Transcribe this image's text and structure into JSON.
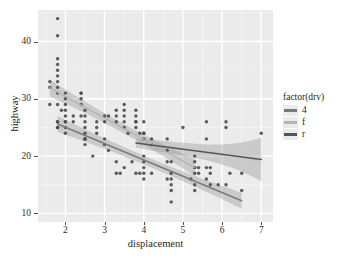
{
  "chart_data": {
    "type": "scatter",
    "title": "",
    "xlabel": "displacement",
    "ylabel": "highway",
    "xlim": [
      1.3,
      7.3
    ],
    "ylim": [
      8.5,
      45.5
    ],
    "xticks": [
      2,
      3,
      4,
      5,
      6,
      7
    ],
    "yticks": [
      10,
      20,
      30,
      40
    ],
    "grid": true,
    "panel_background": "#ebebeb",
    "gridline_color": "#ffffff",
    "point_color": "#4d4d4d",
    "legend": {
      "title": "factor(drv)",
      "position": "right",
      "entries": [
        {
          "label": "4",
          "color": "#7a7a7a"
        },
        {
          "label": "f",
          "color": "#b5b5b5"
        },
        {
          "label": "r",
          "color": "#555555"
        }
      ]
    },
    "series": [
      {
        "name": "4",
        "label": "4",
        "color": "#7a7a7a",
        "smooth": {
          "x_start": 1.8,
          "y_start": 25.6,
          "x_end": 6.5,
          "y_end": 12.2,
          "band": 1.4
        },
        "points": [
          [
            1.8,
            26
          ],
          [
            1.8,
            25
          ],
          [
            1.8,
            26
          ],
          [
            1.8,
            25
          ],
          [
            2.0,
            26
          ],
          [
            2.0,
            25
          ],
          [
            2.0,
            24
          ],
          [
            2.0,
            26
          ],
          [
            2.2,
            26
          ],
          [
            2.5,
            23
          ],
          [
            2.5,
            24
          ],
          [
            2.5,
            23
          ],
          [
            2.5,
            22
          ],
          [
            2.5,
            25
          ],
          [
            2.5,
            23
          ],
          [
            2.7,
            20
          ],
          [
            2.8,
            24
          ],
          [
            3.0,
            22
          ],
          [
            3.0,
            23
          ],
          [
            3.1,
            21
          ],
          [
            3.3,
            19
          ],
          [
            3.3,
            17
          ],
          [
            3.4,
            17
          ],
          [
            3.5,
            18
          ],
          [
            3.7,
            19
          ],
          [
            3.8,
            17
          ],
          [
            3.9,
            17
          ],
          [
            4.0,
            20
          ],
          [
            4.0,
            19
          ],
          [
            4.0,
            18
          ],
          [
            4.0,
            17
          ],
          [
            4.0,
            16
          ],
          [
            4.2,
            17
          ],
          [
            4.6,
            16
          ],
          [
            4.7,
            15
          ],
          [
            4.7,
            16
          ],
          [
            4.7,
            17
          ],
          [
            4.7,
            14
          ],
          [
            4.7,
            12
          ],
          [
            5.2,
            16
          ],
          [
            5.3,
            15
          ],
          [
            5.3,
            14
          ],
          [
            5.4,
            17
          ],
          [
            5.6,
            16
          ],
          [
            5.7,
            15
          ],
          [
            5.9,
            15
          ],
          [
            6.1,
            15
          ],
          [
            6.5,
            14
          ]
        ]
      },
      {
        "name": "f",
        "label": "f",
        "color": "#b5b5b5",
        "smooth": {
          "x_start": 1.6,
          "y_start": 31.9,
          "x_end": 5.3,
          "y_end": 18.0,
          "band": 1.5
        },
        "points": [
          [
            1.6,
            33
          ],
          [
            1.6,
            32
          ],
          [
            1.6,
            29
          ],
          [
            1.8,
            44
          ],
          [
            1.8,
            41
          ],
          [
            1.8,
            37
          ],
          [
            1.8,
            36
          ],
          [
            1.8,
            35
          ],
          [
            1.8,
            34
          ],
          [
            1.8,
            33
          ],
          [
            1.8,
            32
          ],
          [
            1.8,
            31
          ],
          [
            1.8,
            29
          ],
          [
            1.9,
            28
          ],
          [
            2.0,
            31
          ],
          [
            2.0,
            29
          ],
          [
            2.0,
            28
          ],
          [
            2.0,
            27
          ],
          [
            2.0,
            30
          ],
          [
            2.2,
            27
          ],
          [
            2.4,
            31
          ],
          [
            2.4,
            30
          ],
          [
            2.4,
            31
          ],
          [
            2.4,
            29
          ],
          [
            2.4,
            27
          ],
          [
            2.5,
            27
          ],
          [
            2.5,
            26
          ],
          [
            2.5,
            28
          ],
          [
            2.8,
            26
          ],
          [
            2.8,
            25
          ],
          [
            3.0,
            27
          ],
          [
            3.0,
            26
          ],
          [
            3.1,
            27
          ],
          [
            3.3,
            28
          ],
          [
            3.3,
            27
          ],
          [
            3.3,
            26
          ],
          [
            3.5,
            29
          ],
          [
            3.5,
            28
          ],
          [
            3.5,
            27
          ],
          [
            3.5,
            26
          ],
          [
            3.5,
            25
          ],
          [
            3.6,
            24
          ],
          [
            3.8,
            28
          ],
          [
            3.8,
            27
          ],
          [
            3.8,
            26
          ],
          [
            3.8,
            25
          ],
          [
            3.9,
            24
          ],
          [
            4.0,
            26
          ],
          [
            4.0,
            24
          ],
          [
            4.2,
            23
          ],
          [
            4.6,
            19
          ],
          [
            4.7,
            19
          ],
          [
            5.3,
            18
          ],
          [
            5.3,
            17
          ]
        ]
      },
      {
        "name": "r",
        "label": "r",
        "color": "#555555",
        "smooth": {
          "x_start": 3.8,
          "y_start": 22.3,
          "x_end": 7.0,
          "y_end": 19.4,
          "band_start": 0.8,
          "band_end": 3.8
        },
        "points": [
          [
            3.8,
            26
          ],
          [
            4.0,
            24
          ],
          [
            4.0,
            23
          ],
          [
            4.2,
            22
          ],
          [
            4.6,
            21
          ],
          [
            4.6,
            23
          ],
          [
            5.0,
            25
          ],
          [
            5.3,
            20
          ],
          [
            5.3,
            19
          ],
          [
            5.3,
            18
          ],
          [
            5.4,
            18
          ],
          [
            5.6,
            26
          ],
          [
            5.6,
            23
          ],
          [
            5.6,
            18
          ],
          [
            5.7,
            17
          ],
          [
            5.7,
            18
          ],
          [
            6.1,
            26
          ],
          [
            6.1,
            25
          ],
          [
            6.2,
            17
          ],
          [
            6.5,
            17
          ],
          [
            7.0,
            24
          ]
        ]
      }
    ]
  }
}
